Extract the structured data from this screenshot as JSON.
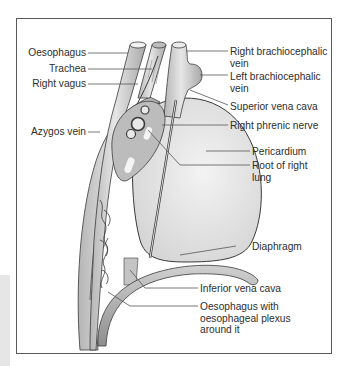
{
  "figure": {
    "colors": {
      "frame": "#5a5a5a",
      "structure_fill": "#cfcfcf",
      "structure_dark": "#9a9a9a",
      "pericardium_fill": "#e4e4e4",
      "outline": "#3a3a3a",
      "leader_line": "#555555",
      "text": "#2e2e2e"
    }
  },
  "labels": {
    "left": [
      {
        "id": "oesophagus",
        "text": "Oesophagus"
      },
      {
        "id": "trachea",
        "text": "Trachea"
      },
      {
        "id": "right_vagus",
        "text": "Right vagus"
      },
      {
        "id": "azygos_vein",
        "text": "Azygos vein"
      }
    ],
    "right": [
      {
        "id": "right_brachiocephalic_vein",
        "text": "Right brachiocephalic vein"
      },
      {
        "id": "left_brachiocephalic_vein",
        "text": "Left brachiocephalic vein"
      },
      {
        "id": "superior_vena_cava",
        "text": "Superior vena cava"
      },
      {
        "id": "right_phrenic_nerve",
        "text": "Right phrenic nerve"
      },
      {
        "id": "pericardium",
        "text": "Pericardium"
      },
      {
        "id": "root_of_right_lung",
        "text": "Root of right lung"
      },
      {
        "id": "diaphragm",
        "text": "Diaphragm"
      },
      {
        "id": "inferior_vena_cava",
        "text": "Inferior vena cava"
      },
      {
        "id": "oesophagus_with_plexus",
        "text": "Oesophagus with oesophageal plexus around it"
      }
    ]
  }
}
